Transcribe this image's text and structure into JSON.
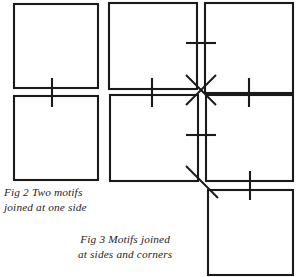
{
  "page": {
    "background_color": "#ffffff",
    "ink_color": "#1a1a18",
    "width": 297,
    "height": 277
  },
  "figures": [
    {
      "id": "fig2",
      "number": "Fig 2",
      "caption_line_1": "Fig 2  Two motifs",
      "caption_line_2": "joined at one side",
      "caption_full": "Fig 2  Two motifs joined at one side",
      "motif_count": 2,
      "join_type": "one side",
      "squares": [
        {
          "name": "top-square",
          "x": 14,
          "y": 4,
          "w": 84,
          "h": 84
        },
        {
          "name": "bottom-square",
          "x": 14,
          "y": 96,
          "w": 84,
          "h": 84
        }
      ],
      "joins": [
        {
          "name": "side-join-tick",
          "orientation": "vertical",
          "x": 52,
          "y1": 78,
          "y2": 107
        }
      ]
    },
    {
      "id": "fig3",
      "number": "Fig 3",
      "caption_line_1": "Fig 3 Motifs joined",
      "caption_line_2": "at sides and corners",
      "caption_full": "Fig 3 Motifs joined at sides and corners",
      "motif_count": 5,
      "join_type": "sides and corners",
      "squares": [
        {
          "name": "top-left-square",
          "x": 109,
          "y": 3,
          "w": 88,
          "h": 86
        },
        {
          "name": "top-right-square",
          "x": 205,
          "y": 3,
          "w": 88,
          "h": 90
        },
        {
          "name": "bottom-left-square",
          "x": 110,
          "y": 95,
          "w": 88,
          "h": 86
        },
        {
          "name": "bottom-right-square",
          "x": 206,
          "y": 95,
          "w": 87,
          "h": 86
        },
        {
          "name": "lower-corner-square",
          "x": 208,
          "y": 190,
          "w": 85,
          "h": 85
        }
      ],
      "joins": [
        {
          "name": "top-side-join-tick",
          "orientation": "horizontal",
          "y": 43,
          "x1": 186,
          "x2": 216
        },
        {
          "name": "left-side-join-tick",
          "orientation": "vertical",
          "x": 152,
          "y1": 78,
          "y2": 107
        },
        {
          "name": "right-side-join-tick",
          "orientation": "vertical",
          "x": 249,
          "y1": 78,
          "y2": 107
        },
        {
          "name": "bottom-side-join-tick",
          "orientation": "horizontal",
          "y": 135,
          "x1": 186,
          "x2": 216
        },
        {
          "name": "lower-right-side-join-tick",
          "orientation": "vertical",
          "x": 250,
          "y1": 171,
          "y2": 200
        },
        {
          "name": "corner-join-diagonal-nwse",
          "orientation": "diagonal",
          "x1": 186,
          "y1": 75,
          "x2": 216,
          "y2": 105
        },
        {
          "name": "corner-join-diagonal-nesw",
          "orientation": "diagonal",
          "x1": 216,
          "y1": 75,
          "x2": 186,
          "y2": 105
        },
        {
          "name": "lower-corner-join-diagonal",
          "orientation": "diagonal",
          "x1": 186,
          "y1": 166,
          "x2": 218,
          "y2": 198
        }
      ]
    }
  ]
}
